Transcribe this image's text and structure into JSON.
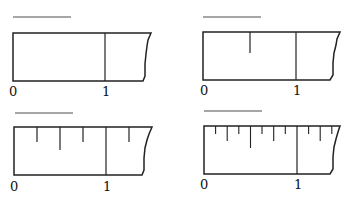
{
  "figure": {
    "line_color": "#222222",
    "blank_color": "#888888",
    "rulers": [
      {
        "id": "ruler-whole",
        "divisions": 1,
        "labels": {
          "zero": "0",
          "one": "1"
        },
        "blank_answer_line": true
      },
      {
        "id": "ruler-halves",
        "divisions": 2,
        "labels": {
          "zero": "0",
          "one": "1"
        },
        "blank_answer_line": true
      },
      {
        "id": "ruler-quarters",
        "divisions": 4,
        "labels": {
          "zero": "0",
          "one": "1"
        },
        "blank_answer_line": true
      },
      {
        "id": "ruler-eighths",
        "divisions": 8,
        "labels": {
          "zero": "0",
          "one": "1"
        },
        "blank_answer_line": true
      }
    ]
  }
}
